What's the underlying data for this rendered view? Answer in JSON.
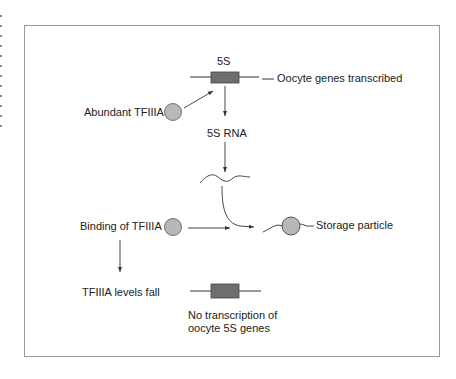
{
  "figure": {
    "top_gene": {
      "label": "5S",
      "annotation": "Oocyte genes transcribed"
    },
    "abundant_factor": {
      "label": "Abundant TFIIIA"
    },
    "rna": {
      "label": "5S RNA"
    },
    "binding": {
      "label": "Binding of TFIIIA"
    },
    "storage": {
      "label": "Storage particle"
    },
    "levels": {
      "label": "TFIIIA levels fall"
    },
    "bottom_gene": {
      "annotation_line1": "No transcription of",
      "annotation_line2": "oocyte 5S genes"
    }
  },
  "colors": {
    "gene_box": "#6e6e6e",
    "protein_circle": "#b8b8b8",
    "line": "#333333",
    "frame": "#9a9a9a"
  }
}
